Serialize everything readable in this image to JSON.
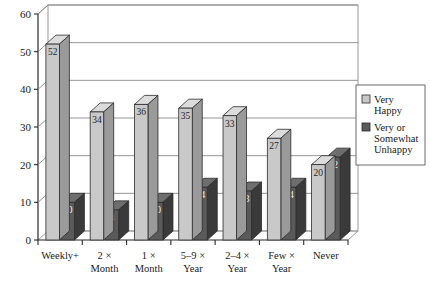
{
  "chart_data": {
    "type": "bar",
    "title": "",
    "xlabel": "",
    "ylabel": "",
    "ylim": [
      0,
      60
    ],
    "ytick_values": [
      0,
      10,
      20,
      30,
      40,
      50,
      60
    ],
    "ytick_labels": [
      "0",
      "10",
      "20",
      "30",
      "40",
      "50",
      "60"
    ],
    "grid": true,
    "grid_axis": "y",
    "legend_position": "right",
    "categories": [
      "Weekly+",
      "2 × Month",
      "1 × Month",
      "5–9 × Year",
      "2–4 × Year",
      "Few × Year",
      "Never"
    ],
    "category_lines": [
      [
        "Weekly+"
      ],
      [
        "2 ×",
        "Month"
      ],
      [
        "1 ×",
        "Month"
      ],
      [
        "5–9 ×",
        "Year"
      ],
      [
        "2–4 ×",
        "Year"
      ],
      [
        "Few ×",
        "Year"
      ],
      [
        "Never"
      ]
    ],
    "series": [
      {
        "name": "Very Happy",
        "values": [
          52,
          34,
          36,
          35,
          33,
          27,
          20
        ],
        "color": "#c9c9c9",
        "side_color": "#9a9a9a",
        "top_color": "#dcdcdc",
        "label_color": "dark"
      },
      {
        "name": "Very or Somewhat Unhappy",
        "values": [
          10,
          8,
          10,
          14,
          13,
          14,
          22
        ],
        "color": "#5a5a5a",
        "side_color": "#3a3a3a",
        "top_color": "#6e6e6e",
        "label_color": "light"
      }
    ]
  },
  "legend": {
    "entries": [
      {
        "lines": [
          "Very",
          "Happy"
        ],
        "swatch": "#c9c9c9"
      },
      {
        "lines": [
          "Very or",
          "Somewhat",
          "Unhappy"
        ],
        "swatch": "#5a5a5a"
      }
    ]
  },
  "colors": {
    "axis": "#2b2b2b",
    "grid": "#8a8a8a",
    "frame": "#9a9a9a",
    "background": "#ffffff",
    "legend_border": "#6b6b6b"
  }
}
